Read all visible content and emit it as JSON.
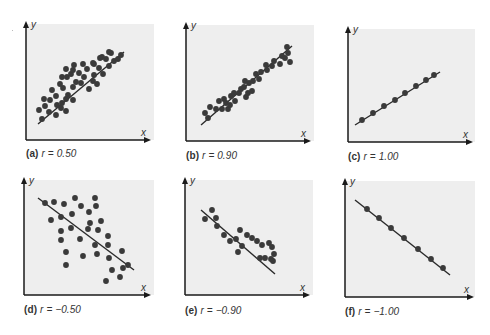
{
  "figure": {
    "background": "#ffffff",
    "plot_background": "#eeeeee",
    "axis_color": "#1a1a1a",
    "point_color": "#3a3a3a",
    "line_color": "#2a2a2a"
  },
  "panels": [
    {
      "id": "a",
      "label": "(a)",
      "r_text": "r = 0.50",
      "box": {
        "x": 26,
        "y": 22,
        "w": 124,
        "h": 118
      },
      "bg_w": 128,
      "caption_pos": {
        "x": 26,
        "y": 148
      },
      "line": [
        [
          12,
          102
        ],
        [
          98,
          30
        ]
      ],
      "points": [
        [
          13,
          88
        ],
        [
          19,
          84
        ],
        [
          16,
          97
        ],
        [
          23,
          90
        ],
        [
          30,
          93
        ],
        [
          35,
          86
        ],
        [
          31,
          83
        ],
        [
          40,
          89
        ],
        [
          24,
          78
        ],
        [
          30,
          74
        ],
        [
          26,
          68
        ],
        [
          18,
          77
        ],
        [
          36,
          81
        ],
        [
          40,
          77
        ],
        [
          47,
          78
        ],
        [
          42,
          73
        ],
        [
          37,
          66
        ],
        [
          34,
          62
        ],
        [
          47,
          65
        ],
        [
          50,
          60
        ],
        [
          41,
          55
        ],
        [
          36,
          55
        ],
        [
          45,
          52
        ],
        [
          47,
          48
        ],
        [
          53,
          51
        ],
        [
          57,
          42
        ],
        [
          48,
          43
        ],
        [
          40,
          47
        ],
        [
          55,
          61
        ],
        [
          63,
          67
        ],
        [
          67,
          59
        ],
        [
          71,
          62
        ],
        [
          68,
          53
        ],
        [
          73,
          46
        ],
        [
          77,
          52
        ],
        [
          83,
          44
        ],
        [
          80,
          37
        ],
        [
          76,
          35
        ],
        [
          68,
          42
        ],
        [
          61,
          47
        ],
        [
          67,
          41
        ],
        [
          88,
          39
        ],
        [
          85,
          31
        ],
        [
          92,
          37
        ],
        [
          95,
          33
        ],
        [
          83,
          30
        ],
        [
          74,
          36
        ],
        [
          58,
          55
        ]
      ]
    },
    {
      "id": "b",
      "label": "(b)",
      "r_text": "r = 0.90",
      "box": {
        "x": 186,
        "y": 23,
        "w": 124,
        "h": 118
      },
      "bg_w": 128,
      "caption_pos": {
        "x": 186,
        "y": 150
      },
      "line": [
        [
          15,
          102
        ],
        [
          106,
          23
        ]
      ],
      "points": [
        [
          19,
          90
        ],
        [
          22,
          95
        ],
        [
          24,
          84
        ],
        [
          30,
          86
        ],
        [
          33,
          78
        ],
        [
          36,
          86
        ],
        [
          38,
          76
        ],
        [
          40,
          80
        ],
        [
          42,
          86
        ],
        [
          44,
          82
        ],
        [
          45,
          73
        ],
        [
          49,
          78
        ],
        [
          48,
          70
        ],
        [
          53,
          70
        ],
        [
          55,
          66
        ],
        [
          58,
          64
        ],
        [
          60,
          74
        ],
        [
          62,
          70
        ],
        [
          59,
          58
        ],
        [
          63,
          60
        ],
        [
          67,
          58
        ],
        [
          70,
          51
        ],
        [
          73,
          56
        ],
        [
          75,
          49
        ],
        [
          81,
          47
        ],
        [
          86,
          43
        ],
        [
          88,
          38
        ],
        [
          94,
          41
        ],
        [
          99,
          35
        ],
        [
          104,
          39
        ],
        [
          101,
          24
        ],
        [
          102,
          30
        ],
        [
          96,
          33
        ],
        [
          80,
          42
        ],
        [
          66,
          68
        ]
      ]
    },
    {
      "id": "c",
      "label": "(c)",
      "r_text": "r = 1.00",
      "box": {
        "x": 348,
        "y": 27,
        "w": 124,
        "h": 115
      },
      "bg_w": 127,
      "caption_pos": {
        "x": 348,
        "y": 151
      },
      "line": [
        [
          7,
          98
        ],
        [
          92,
          45
        ]
      ],
      "points": [
        [
          14,
          93
        ],
        [
          25,
          86
        ],
        [
          36,
          79
        ],
        [
          47,
          73
        ],
        [
          57,
          66
        ],
        [
          68,
          59
        ],
        [
          78,
          53
        ],
        [
          86,
          48
        ]
      ]
    },
    {
      "id": "d",
      "label": "(d)",
      "r_text": "r = −0.50",
      "box": {
        "x": 24,
        "y": 178,
        "w": 126,
        "h": 117
      },
      "bg_w": 130,
      "caption_pos": {
        "x": 24,
        "y": 304
      },
      "line": [
        [
          14,
          20
        ],
        [
          110,
          92
        ]
      ],
      "points": [
        [
          21,
          25
        ],
        [
          30,
          24
        ],
        [
          40,
          26
        ],
        [
          51,
          20
        ],
        [
          57,
          28
        ],
        [
          71,
          20
        ],
        [
          72,
          28
        ],
        [
          27,
          42
        ],
        [
          37,
          39
        ],
        [
          48,
          36
        ],
        [
          65,
          34
        ],
        [
          66,
          45
        ],
        [
          77,
          43
        ],
        [
          37,
          53
        ],
        [
          47,
          50
        ],
        [
          64,
          51
        ],
        [
          74,
          52
        ],
        [
          37,
          62
        ],
        [
          42,
          74
        ],
        [
          56,
          61
        ],
        [
          71,
          67
        ],
        [
          84,
          58
        ],
        [
          84,
          67
        ],
        [
          42,
          87
        ],
        [
          59,
          78
        ],
        [
          73,
          76
        ],
        [
          85,
          80
        ],
        [
          98,
          73
        ],
        [
          104,
          87
        ],
        [
          88,
          92
        ],
        [
          99,
          90
        ],
        [
          82,
          103
        ],
        [
          96,
          99
        ]
      ]
    },
    {
      "id": "e",
      "label": "(e)",
      "r_text": "r = −0.90",
      "box": {
        "x": 185,
        "y": 178,
        "w": 124,
        "h": 117
      },
      "bg_w": 128,
      "caption_pos": {
        "x": 185,
        "y": 305
      },
      "line": [
        [
          16,
          32
        ],
        [
          90,
          96
        ]
      ],
      "points": [
        [
          20,
          41
        ],
        [
          27,
          32
        ],
        [
          31,
          40
        ],
        [
          32,
          48
        ],
        [
          39,
          57
        ],
        [
          45,
          63
        ],
        [
          51,
          61
        ],
        [
          55,
          52
        ],
        [
          57,
          68
        ],
        [
          62,
          57
        ],
        [
          67,
          60
        ],
        [
          72,
          63
        ],
        [
          77,
          67
        ],
        [
          84,
          65
        ],
        [
          89,
          76
        ],
        [
          87,
          69
        ],
        [
          86,
          81
        ],
        [
          80,
          80
        ],
        [
          88,
          83
        ],
        [
          53,
          74
        ],
        [
          75,
          80
        ]
      ]
    },
    {
      "id": "f",
      "label": "(f)",
      "r_text": "r = −1.00",
      "box": {
        "x": 345,
        "y": 179,
        "w": 128,
        "h": 118
      },
      "bg_w": 130,
      "caption_pos": {
        "x": 345,
        "y": 306
      },
      "line": [
        [
          10,
          21
        ],
        [
          105,
          96
        ]
      ],
      "points": [
        [
          22,
          30
        ],
        [
          34,
          39
        ],
        [
          46,
          49
        ],
        [
          59,
          59
        ],
        [
          73,
          70
        ],
        [
          86,
          80
        ],
        [
          98,
          89
        ]
      ]
    }
  ],
  "chart_data": [
    {
      "type": "scatter",
      "title": "(a) r = 0.50",
      "xlabel": "x",
      "ylabel": "y",
      "correlation": 0.5,
      "trend_line": "positive slope",
      "n_points": 48,
      "grid": false
    },
    {
      "type": "scatter",
      "title": "(b) r = 0.90",
      "xlabel": "x",
      "ylabel": "y",
      "correlation": 0.9,
      "trend_line": "positive slope",
      "n_points": 35,
      "grid": false
    },
    {
      "type": "scatter",
      "title": "(c) r = 1.00",
      "xlabel": "x",
      "ylabel": "y",
      "correlation": 1.0,
      "trend_line": "positive slope",
      "n_points": 8,
      "grid": false
    },
    {
      "type": "scatter",
      "title": "(d) r = −0.50",
      "xlabel": "x",
      "ylabel": "y",
      "correlation": -0.5,
      "trend_line": "negative slope",
      "n_points": 33,
      "grid": false
    },
    {
      "type": "scatter",
      "title": "(e) r = −0.90",
      "xlabel": "x",
      "ylabel": "y",
      "correlation": -0.9,
      "trend_line": "negative slope",
      "n_points": 21,
      "grid": false
    },
    {
      "type": "scatter",
      "title": "(f) r = −1.00",
      "xlabel": "x",
      "ylabel": "y",
      "correlation": -1.0,
      "trend_line": "negative slope",
      "n_points": 7,
      "grid": false
    }
  ],
  "axis_labels": {
    "x": "x",
    "y": "y"
  }
}
